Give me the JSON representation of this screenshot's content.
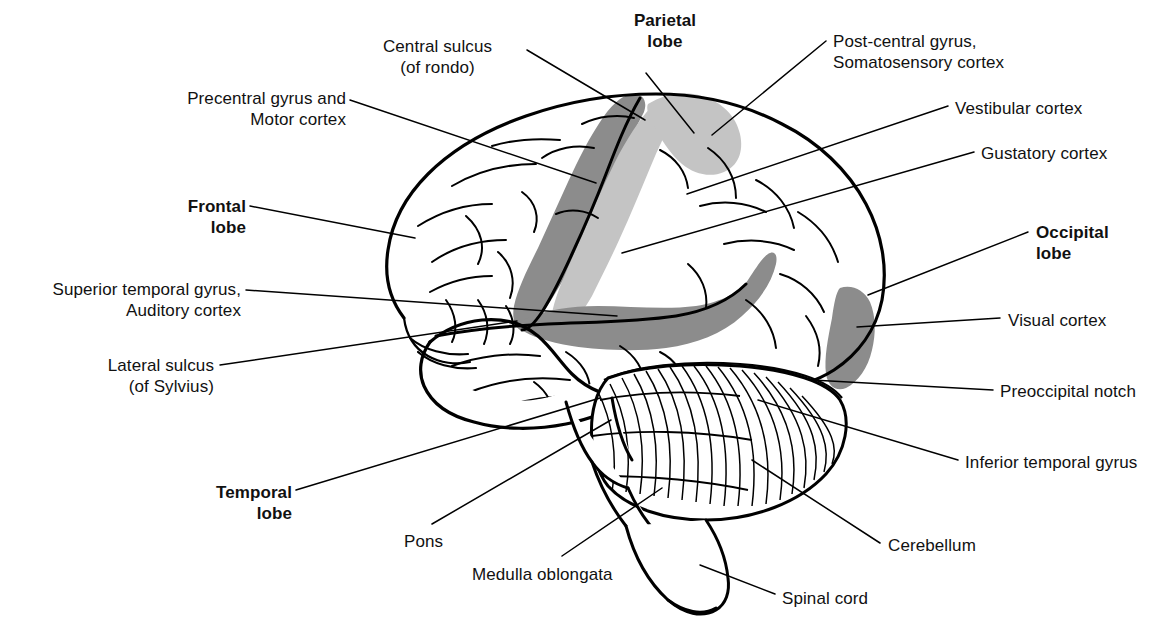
{
  "figure": {
    "background_color": "#ffffff",
    "line_color": "#000000",
    "shade_dark": "#8c8c8c",
    "shade_light": "#c4c4c4"
  },
  "labels": [
    {
      "id": "central-sulcus",
      "text": "Central sulcus\n(of rondo)",
      "bold": false,
      "align": "center",
      "x": 345,
      "y": 36,
      "w": 185
    },
    {
      "id": "parietal-lobe",
      "text": "Parietal\nlobe",
      "bold": true,
      "align": "center",
      "x": 610,
      "y": 10,
      "w": 110
    },
    {
      "id": "post-central-gyrus",
      "text": "Post-central gyrus,\nSomatosensory cortex",
      "bold": false,
      "align": "left",
      "x": 833,
      "y": 31,
      "w": 230
    },
    {
      "id": "precentral-gyrus",
      "text": "Precentral gyrus and\nMotor cortex",
      "bold": false,
      "align": "right",
      "x": 148,
      "y": 88,
      "w": 198
    },
    {
      "id": "vestibular-cortex",
      "text": "Vestibular cortex",
      "bold": false,
      "align": "left",
      "x": 955,
      "y": 98,
      "w": 170
    },
    {
      "id": "gustatory-cortex",
      "text": "Gustatory cortex",
      "bold": false,
      "align": "left",
      "x": 981,
      "y": 143,
      "w": 165
    },
    {
      "id": "frontal-lobe",
      "text": "Frontal\nlobe",
      "bold": true,
      "align": "right",
      "x": 150,
      "y": 196,
      "w": 96
    },
    {
      "id": "occipital-lobe",
      "text": "Occipital\nlobe",
      "bold": true,
      "align": "left",
      "x": 1036,
      "y": 222,
      "w": 104
    },
    {
      "id": "superior-temporal-gyrus",
      "text": "Superior temporal gyrus,\nAuditory cortex",
      "bold": false,
      "align": "right",
      "x": 16,
      "y": 279,
      "w": 225
    },
    {
      "id": "visual-cortex",
      "text": "Visual cortex",
      "bold": false,
      "align": "left",
      "x": 1008,
      "y": 310,
      "w": 135
    },
    {
      "id": "lateral-sulcus",
      "text": "Lateral sulcus\n(of Sylvius)",
      "bold": false,
      "align": "right",
      "x": 66,
      "y": 355,
      "w": 148
    },
    {
      "id": "preoccipital-notch",
      "text": "Preoccipital notch",
      "bold": false,
      "align": "left",
      "x": 1000,
      "y": 381,
      "w": 180
    },
    {
      "id": "inferior-temporal-gyrus",
      "text": "Inferior temporal gyrus",
      "bold": false,
      "align": "left",
      "x": 965,
      "y": 452,
      "w": 210
    },
    {
      "id": "temporal-lobe",
      "text": "Temporal\nlobe",
      "bold": true,
      "align": "right",
      "x": 182,
      "y": 482,
      "w": 110
    },
    {
      "id": "cerebellum",
      "text": "Cerebellum",
      "bold": false,
      "align": "left",
      "x": 888,
      "y": 535,
      "w": 120
    },
    {
      "id": "pons",
      "text": "Pons",
      "bold": false,
      "align": "left",
      "x": 404,
      "y": 531,
      "w": 60
    },
    {
      "id": "medulla-oblongata",
      "text": "Medulla oblongata",
      "bold": false,
      "align": "left",
      "x": 472,
      "y": 564,
      "w": 175
    },
    {
      "id": "spinal-cord",
      "text": "Spinal cord",
      "bold": false,
      "align": "left",
      "x": 782,
      "y": 588,
      "w": 120
    }
  ],
  "leader_lines": [
    {
      "id": "leader-central-sulcus",
      "points": "527,50 645,120"
    },
    {
      "id": "leader-parietal-lobe",
      "points": "646,73 694,133"
    },
    {
      "id": "leader-post-central-gyrus",
      "points": "826,41 712,135"
    },
    {
      "id": "leader-precentral-gyrus",
      "points": "350,100 596,183"
    },
    {
      "id": "leader-vestibular-cortex",
      "points": "948,106 687,194"
    },
    {
      "id": "leader-gustatory-cortex",
      "points": "974,152 622,253"
    },
    {
      "id": "leader-frontal-lobe",
      "points": "250,206 415,238"
    },
    {
      "id": "leader-occipital-lobe",
      "points": "1028,232 868,295"
    },
    {
      "id": "leader-superior-temporal-gyrus",
      "points": "246,290 617,316"
    },
    {
      "id": "leader-visual-cortex",
      "points": "1000,318 857,327"
    },
    {
      "id": "leader-lateral-sulcus",
      "points": "220,365 517,321"
    },
    {
      "id": "leader-preoccipital-notch",
      "points": "993,390 812,380"
    },
    {
      "id": "leader-inferior-temporal-gyrus",
      "points": "958,460 758,400"
    },
    {
      "id": "leader-temporal-lobe",
      "points": "296,490 600,398"
    },
    {
      "id": "leader-cerebellum",
      "points": "880,543 752,460"
    },
    {
      "id": "leader-pons",
      "points": "432,524 611,420"
    },
    {
      "id": "leader-medulla-oblongata",
      "points": "562,556 662,488"
    },
    {
      "id": "leader-spinal-cord",
      "points": "775,594 700,565"
    }
  ]
}
